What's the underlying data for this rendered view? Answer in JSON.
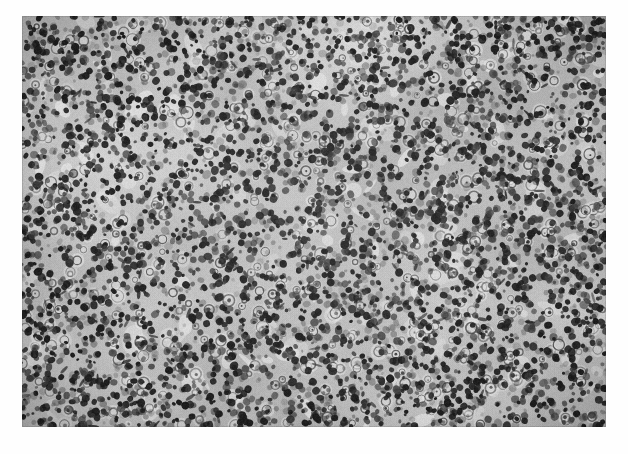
{
  "figure": {
    "kind": "histopathology-micrograph",
    "staining": "hematoxylin-eosin-grayscale",
    "orientation": "landscape",
    "frame": {
      "left": 22,
      "top": 16,
      "width": 584,
      "height": 411
    },
    "tone": {
      "background_gray": "#a6a6a6",
      "stroma_light_gray": "#c4c4c4",
      "highlight_gray": "#e4e4e4",
      "nucleus_dark": "#1d1d1d",
      "nucleus_mid": "#3c3c3c",
      "border_gray": "#8f8f8f"
    }
  },
  "caption": {
    "text": ""
  },
  "chart_data": {
    "type": "heatmap",
    "title": "",
    "xlabel": "",
    "ylabel": ""
  },
  "render": {
    "seed": 20240517,
    "cell_count": 5200,
    "large_cell_count": 520,
    "pale_blob_count": 150,
    "noise_opacity": 0.26
  }
}
